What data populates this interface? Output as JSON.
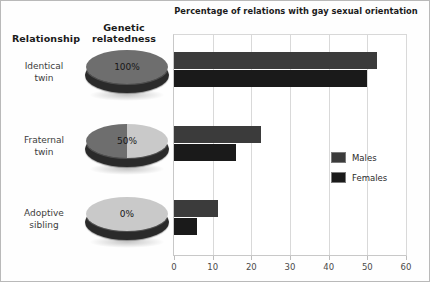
{
  "left_panel": {
    "headers": {
      "relationship": "Relationship",
      "relatedness_line1": "Genetic",
      "relatedness_line2": "relatedness"
    },
    "rows": [
      {
        "label_line1": "Identical",
        "label_line2": "twin",
        "relatedness": "100%"
      },
      {
        "label_line1": "Fraternal",
        "label_line2": "twin",
        "relatedness": "50%"
      },
      {
        "label_line1": "Adoptive",
        "label_line2": "sibling",
        "relatedness": "0%"
      }
    ]
  },
  "colors": {
    "males": "#3b3b3b",
    "females": "#1a1a1a",
    "disc_dark": "#6e6e6e",
    "disc_light": "#c9c9c9",
    "disc_side": "#2a2a2a",
    "grid": "#d9d9d9"
  },
  "chart_data": {
    "type": "bar",
    "orientation": "horizontal",
    "title": "Percentage of relations with gay sexual orientation",
    "xlabel": "",
    "ylabel": "",
    "categories": [
      "Identical twin",
      "Fraternal twin",
      "Adoptive sibling"
    ],
    "series": [
      {
        "name": "Males",
        "values": [
          52.5,
          22.5,
          11.5
        ]
      },
      {
        "name": "Females",
        "values": [
          50.0,
          16.0,
          6.0
        ]
      }
    ],
    "xlim": [
      0,
      60
    ],
    "xticks": [
      0,
      10,
      20,
      30,
      40,
      50,
      60
    ],
    "xtick_labels": [
      "0",
      "10",
      "20",
      "30",
      "40",
      "50",
      "60"
    ],
    "grid": "vertical",
    "legend_position": "right-middle",
    "legend_entries": [
      "Males",
      "Females"
    ]
  }
}
